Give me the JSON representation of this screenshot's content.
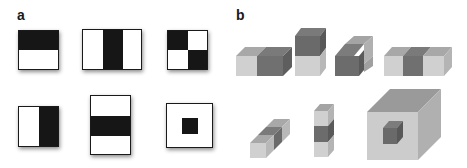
{
  "figure": {
    "panels": [
      {
        "label": "a",
        "title": "2D Haar-like features",
        "features": [
          {
            "name": "two-rect-horizontal",
            "pattern": "top black, bottom white"
          },
          {
            "name": "three-rect-vertical",
            "pattern": "white | black | white"
          },
          {
            "name": "four-rect-checker",
            "pattern": "black/white over white/black"
          },
          {
            "name": "two-rect-vertical",
            "pattern": "left white, right black"
          },
          {
            "name": "three-rect-horizontal",
            "pattern": "white / black / white"
          },
          {
            "name": "center-surround",
            "pattern": "white with black center"
          }
        ]
      },
      {
        "label": "b",
        "title": "3D Haar-like features",
        "features": [
          {
            "name": "cube-two-left-right",
            "pattern": "light left, dark right"
          },
          {
            "name": "cube-two-top-bottom",
            "pattern": "dark top, light bottom"
          },
          {
            "name": "cube-two-front-back",
            "pattern": "dark front, light back"
          },
          {
            "name": "cube-three-horizontal",
            "pattern": "light | dark | light"
          },
          {
            "name": "cube-three-depth",
            "pattern": "light / dark / light along depth"
          },
          {
            "name": "cube-three-vertical",
            "pattern": "light / dark / light stacked"
          },
          {
            "name": "cube-center-surround",
            "pattern": "large light cube with dark inner cube"
          }
        ]
      }
    ],
    "colors": {
      "black": "#161616",
      "white": "#ffffff",
      "dark_front": "#6e6e6e",
      "dark_top": "#7c7c7c",
      "dark_side": "#5c5c5c",
      "light_front": "#cfcfcf",
      "light_top": "#a4a4a4",
      "light_side": "#b4b4b4"
    }
  }
}
